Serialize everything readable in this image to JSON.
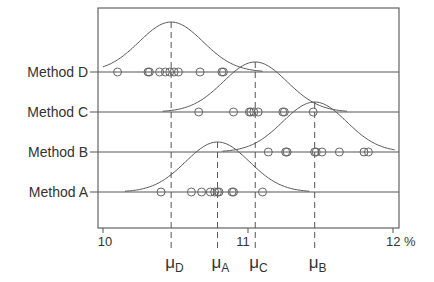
{
  "chart_data": {
    "type": "scatter",
    "subtype": "dot-strip with fitted normal density curves",
    "title": "",
    "xlabel": "",
    "ylabel": "",
    "x_unit": "%",
    "xlim": [
      9.97,
      12.04
    ],
    "xticks": [
      {
        "value": 10,
        "label": "10"
      },
      {
        "value": 11,
        "label": "11"
      },
      {
        "value": 12,
        "label": "12 %"
      }
    ],
    "grid": false,
    "legend": null,
    "series": [
      {
        "name": "Method D",
        "mean": 10.47,
        "mean_label": "μ",
        "mean_sub": "D",
        "values": [
          10.1,
          10.31,
          10.32,
          10.39,
          10.43,
          10.46,
          10.49,
          10.52,
          10.67,
          10.82,
          10.83
        ],
        "curve_sd": 0.22
      },
      {
        "name": "Method C",
        "mean": 11.05,
        "mean_label": "μ",
        "mean_sub": "C",
        "values": [
          10.66,
          10.9,
          11.01,
          11.02,
          11.04,
          11.07,
          11.24,
          11.25,
          11.45
        ],
        "curve_sd": 0.22
      },
      {
        "name": "Method B",
        "mean": 11.46,
        "mean_label": "μ",
        "mean_sub": "B",
        "values": [
          11.14,
          11.26,
          11.27,
          11.46,
          11.47,
          11.51,
          11.63,
          11.8,
          11.83
        ],
        "curve_sd": 0.22
      },
      {
        "name": "Method A",
        "mean": 10.79,
        "mean_label": "μ",
        "mean_sub": "A",
        "values": [
          10.4,
          10.61,
          10.68,
          10.74,
          10.77,
          10.79,
          10.8,
          10.89,
          10.9,
          11.1
        ],
        "curve_sd": 0.22
      }
    ]
  },
  "colors": {
    "line": "#555555",
    "text": "#333333",
    "marker": "#666666",
    "background": "#ffffff"
  }
}
